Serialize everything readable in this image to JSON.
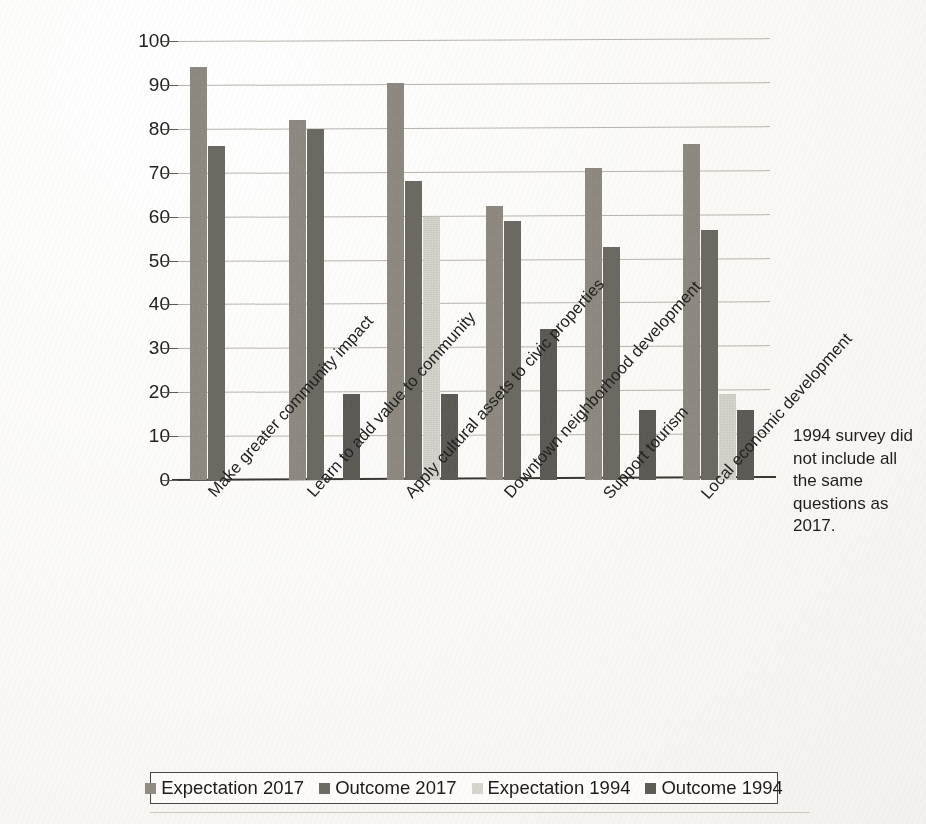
{
  "chart_data": {
    "type": "bar",
    "title": "",
    "xlabel": "",
    "ylabel": "",
    "ylim": [
      0,
      100
    ],
    "yticks": [
      0,
      10,
      20,
      30,
      40,
      50,
      60,
      70,
      80,
      90,
      100
    ],
    "grid": true,
    "legend_position": "bottom",
    "categories": [
      "Make greater community impact",
      "Learn to add value to community",
      "Apply cultural assets to civic properties",
      "Downtown neighborhood development",
      "Support tourism",
      "Local economic development"
    ],
    "series": [
      {
        "name": "Expectation 2017",
        "color": "#918d84",
        "values": [
          94,
          82,
          90.5,
          62.5,
          71,
          76.5
        ]
      },
      {
        "name": "Outcome 2017",
        "color": "#6f6c65",
        "values": [
          76,
          80,
          68,
          59,
          53,
          57
        ]
      },
      {
        "name": "Expectation 1994",
        "color": "#d7d5ce",
        "values": [
          null,
          null,
          60,
          null,
          null,
          19.5
        ]
      },
      {
        "name": "Outcome 1994",
        "color": "#5f5d57",
        "values": [
          null,
          19.7,
          19.7,
          34.5,
          16,
          16
        ]
      }
    ],
    "annotations": [
      {
        "text": "1994 survey did not include all the same questions as 2017."
      }
    ]
  },
  "annotation": {
    "lines": [
      "1994 survey did",
      "not include all",
      "the same",
      "questions as",
      "2017."
    ]
  }
}
